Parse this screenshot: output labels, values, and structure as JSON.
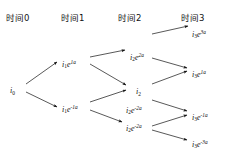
{
  "figure": {
    "type": "lattice-tree",
    "title": "",
    "background": "#ffffff",
    "ink_color": "#111111",
    "width": 228,
    "height": 157
  },
  "columns": [
    {
      "label": "时间0",
      "x": 6,
      "y": 14
    },
    {
      "label": "时间1",
      "x": 61,
      "y": 14
    },
    {
      "label": "时间2",
      "x": 118,
      "y": 14
    },
    {
      "label": "时间3",
      "x": 181,
      "y": 14
    }
  ],
  "nodes": [
    {
      "id": "n0",
      "step": 0,
      "base": "i",
      "sub": "0",
      "e": "",
      "sup": "",
      "x": 10,
      "y": 87
    },
    {
      "id": "n1u",
      "step": 1,
      "base": "i",
      "sub": "1",
      "e": "e",
      "sup": "1a",
      "x": 62,
      "y": 60
    },
    {
      "id": "n1d",
      "step": 1,
      "base": "i",
      "sub": "1",
      "e": "e",
      "sup": "-1a",
      "x": 62,
      "y": 105
    },
    {
      "id": "n2uu",
      "step": 2,
      "base": "i",
      "sub": "2",
      "e": "e",
      "sup": "2a",
      "x": 130,
      "y": 53
    },
    {
      "id": "n2m",
      "step": 2,
      "base": "i",
      "sub": "2",
      "e": "",
      "sup": "",
      "x": 136,
      "y": 88
    },
    {
      "id": "n2md",
      "step": 2,
      "base": "i",
      "sub": "2",
      "e": "e",
      "sup": "-2a",
      "x": 126,
      "y": 106
    },
    {
      "id": "n2dd",
      "step": 2,
      "base": "i",
      "sub": "2",
      "e": "e",
      "sup": "-2a",
      "x": 126,
      "y": 124
    },
    {
      "id": "n3uuu",
      "step": 3,
      "base": "i",
      "sub": "3",
      "e": "e",
      "sup": "3a",
      "x": 192,
      "y": 30
    },
    {
      "id": "n3uud",
      "step": 3,
      "base": "i",
      "sub": "3",
      "e": "e",
      "sup": "1a",
      "x": 192,
      "y": 70
    },
    {
      "id": "n3udd",
      "step": 3,
      "base": "i",
      "sub": "3",
      "e": "e",
      "sup": "-1a",
      "x": 192,
      "y": 113
    },
    {
      "id": "n3ddd",
      "step": 3,
      "base": "i",
      "sub": "3",
      "e": "e",
      "sup": "-3a",
      "x": 192,
      "y": 140
    }
  ],
  "edges": [
    {
      "from": "n0",
      "to": "n1u",
      "x1": 26,
      "y1": 84,
      "x2": 57,
      "y2": 62
    },
    {
      "from": "n0",
      "to": "n1d",
      "x1": 26,
      "y1": 92,
      "x2": 57,
      "y2": 107
    },
    {
      "from": "n1u",
      "to": "n2uu",
      "x1": 90,
      "y1": 57,
      "x2": 125,
      "y2": 50
    },
    {
      "from": "n1u",
      "to": "n2m",
      "x1": 90,
      "y1": 64,
      "x2": 126,
      "y2": 85
    },
    {
      "from": "n1d",
      "to": "n2md",
      "x1": 90,
      "y1": 102,
      "x2": 126,
      "y2": 90
    },
    {
      "from": "n1d",
      "to": "n2dd",
      "x1": 90,
      "y1": 110,
      "x2": 122,
      "y2": 122
    },
    {
      "from": "n2uu",
      "to": "n3uuu",
      "x1": 152,
      "y1": 34,
      "x2": 188,
      "y2": 26
    },
    {
      "from": "n2uu",
      "to": "n3uud",
      "x1": 152,
      "y1": 58,
      "x2": 187,
      "y2": 68
    },
    {
      "from": "n2m",
      "to": "n3uud",
      "x1": 152,
      "y1": 84,
      "x2": 187,
      "y2": 71
    },
    {
      "from": "n2md",
      "to": "n3udd",
      "x1": 152,
      "y1": 100,
      "x2": 187,
      "y2": 111
    },
    {
      "from": "n2dd",
      "to": "n3udd",
      "x1": 152,
      "y1": 126,
      "x2": 187,
      "y2": 115
    },
    {
      "from": "n2dd",
      "to": "n3ddd",
      "x1": 152,
      "y1": 130,
      "x2": 187,
      "y2": 140
    }
  ]
}
